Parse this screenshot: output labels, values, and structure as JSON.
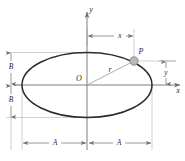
{
  "figure": {
    "type": "geometry-diagram",
    "canvas": {
      "width": 185,
      "height": 161,
      "background": "#ffffff"
    },
    "colors": {
      "curve": "#2b2b2b",
      "axis": "#6f6f6f",
      "dimension": "#6f6f6f",
      "extension": "#9a9a9a",
      "radius_line": "#9a9a9a",
      "point_fill": "#b8b8b8",
      "point_stroke": "#7a7a7a",
      "text": "#2b2b2b"
    },
    "axes": {
      "x_label": "x",
      "y_label": "y",
      "origin_label": "O"
    },
    "ellipse": {
      "center_x": 87,
      "center_y": 85,
      "semi_major_px": 65,
      "semi_minor_px": 32.5,
      "semi_major_label": "A",
      "semi_minor_label": "B"
    },
    "point": {
      "label": "P",
      "x": 134,
      "y": 61,
      "radius_px": 4.2
    },
    "radius": {
      "label": "r",
      "from_x": 87,
      "from_y": 85,
      "to_x": 134,
      "to_y": 61
    },
    "dimensions": [
      {
        "id": "x-dimension",
        "label": "x",
        "orientation": "horizontal",
        "value_px": 47
      },
      {
        "id": "y-dimension",
        "label": "y",
        "orientation": "vertical",
        "value_px": 24
      },
      {
        "id": "b-dimension-upper",
        "label": "B",
        "orientation": "vertical",
        "value_px": 33
      },
      {
        "id": "b-dimension-lower",
        "label": "B",
        "orientation": "vertical",
        "value_px": 32
      },
      {
        "id": "a-dimension-left",
        "label": "A",
        "orientation": "horizontal",
        "value_px": 65
      },
      {
        "id": "a-dimension-right",
        "label": "A",
        "orientation": "horizontal",
        "value_px": 65
      }
    ]
  }
}
